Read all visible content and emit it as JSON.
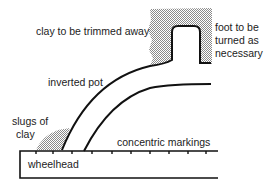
{
  "diagram": {
    "labels": {
      "clay_trimmed": "clay to be trimmed away",
      "foot_line1": "foot to be",
      "foot_line2": "turned as",
      "foot_line3": "necessary",
      "inverted_pot": "inverted pot",
      "slugs_line1": "slugs of",
      "slugs_line2": "clay",
      "concentric": "concentric markings",
      "wheelhead": "wheelhead"
    },
    "colors": {
      "line": "#111111",
      "hatch": "#9a9a9a",
      "background": "#ffffff"
    }
  }
}
